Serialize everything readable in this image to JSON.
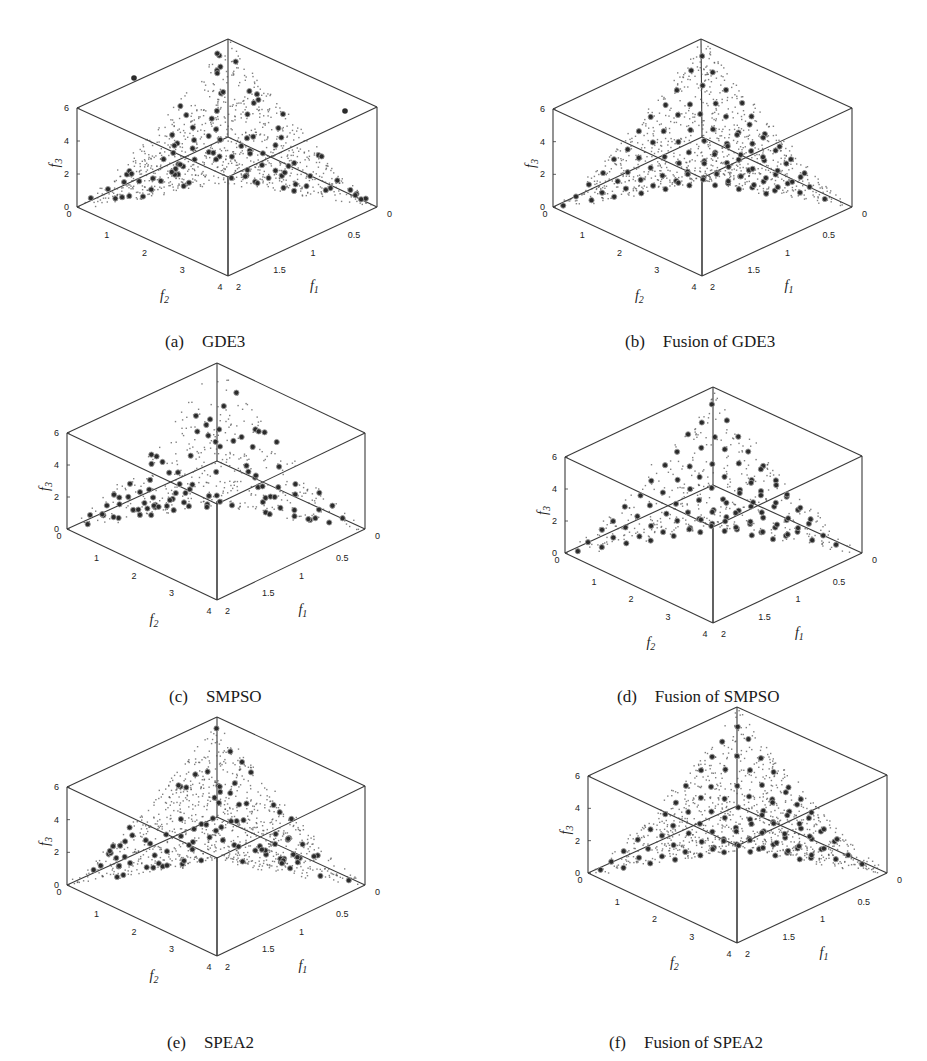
{
  "figure": {
    "panels": [
      {
        "id": "a",
        "tag": "(a)",
        "title": "GDE3",
        "caption_pos": [
          148,
          312
        ],
        "geom": {
          "top": [
            228,
            39
          ],
          "left6": [
            77,
            108
          ],
          "right6": [
            377,
            107
          ],
          "left0": [
            77,
            207
          ],
          "right0": [
            377,
            207
          ],
          "front": [
            228,
            276
          ],
          "back": [
            228,
            137
          ]
        },
        "density": "dense",
        "big_markers": 95,
        "outliers": [
          [
            134,
            78
          ],
          [
            345,
            111
          ]
        ]
      },
      {
        "id": "b",
        "tag": "(b)",
        "title": "Fusion of GDE3",
        "caption_pos": [
          608,
          312
        ],
        "geom": {
          "top": [
            701,
            39
          ],
          "left6": [
            553,
            109
          ],
          "right6": [
            852,
            108
          ],
          "left0": [
            553,
            207
          ],
          "right0": [
            852,
            207
          ],
          "front": [
            702,
            276
          ],
          "back": [
            702,
            137
          ]
        },
        "density": "dense",
        "big_markers": 100,
        "outliers": []
      },
      {
        "id": "c",
        "tag": "(c)",
        "title": "SMPSO",
        "caption_pos": [
          152,
          667
        ],
        "geom": {
          "top": [
            217,
            363
          ],
          "left6": [
            67,
            433
          ],
          "right6": [
            365,
            433
          ],
          "left0": [
            67,
            529
          ],
          "right0": [
            365,
            529
          ],
          "front": [
            217,
            600
          ],
          "back": [
            217,
            461
          ]
        },
        "density": "sparse",
        "big_markers": 95,
        "outliers": []
      },
      {
        "id": "d",
        "tag": "(d)",
        "title": "Fusion of SMPSO",
        "caption_pos": [
          600,
          667
        ],
        "geom": {
          "top": [
            713,
            387
          ],
          "left6": [
            565,
            457
          ],
          "right6": [
            862,
            456
          ],
          "left0": [
            565,
            553
          ],
          "right0": [
            862,
            553
          ],
          "front": [
            713,
            623
          ],
          "back": [
            713,
            485
          ]
        },
        "density": "sparse",
        "big_markers": 100,
        "outliers": []
      },
      {
        "id": "e",
        "tag": "(e)",
        "title": "SPEA2",
        "caption_pos": [
          150,
          1013
        ],
        "geom": {
          "top": [
            217,
            717
          ],
          "left6": [
            67,
            787
          ],
          "right6": [
            365,
            786
          ],
          "left0": [
            67,
            885
          ],
          "right0": [
            365,
            885
          ],
          "front": [
            217,
            956
          ],
          "back": [
            217,
            817
          ]
        },
        "density": "dense",
        "big_markers": 95,
        "outliers": []
      },
      {
        "id": "f",
        "tag": "(f)",
        "title": "Fusion of SPEA2",
        "caption_pos": [
          592,
          1013
        ],
        "geom": {
          "top": [
            737,
            707
          ],
          "left6": [
            588,
            776
          ],
          "right6": [
            887,
            775
          ],
          "left0": [
            588,
            873
          ],
          "right0": [
            887,
            873
          ],
          "front": [
            737,
            943
          ],
          "back": [
            737,
            806
          ]
        },
        "density": "dense",
        "big_markers": 100,
        "outliers": []
      }
    ],
    "axes": {
      "f3_label": "f3",
      "f2_label": "f2",
      "f1_label": "f1",
      "f3_ticks": [
        "0",
        "2",
        "4",
        "6"
      ],
      "f2_ticks": [
        "0",
        "1",
        "2",
        "3",
        "4"
      ],
      "f1_ticks": [
        "0",
        "0.5",
        "1",
        "1.5",
        "2"
      ],
      "f1_range": [
        0,
        2
      ],
      "f2_range": [
        0,
        4
      ],
      "f3_range": [
        0,
        6
      ]
    },
    "colors": {
      "box": "#3a3a3a",
      "dot": "#555555",
      "marker_fill": "#2b2b2b",
      "marker_ring": "#9a9a9a",
      "text": "#222222"
    }
  },
  "chart_data": [
    {
      "type": "scatter",
      "subtype": "3d-scatter",
      "title": "(a) GDE3",
      "xlabel": "f1",
      "ylabel": "f2",
      "zlabel": "f3",
      "xlim": [
        0,
        2
      ],
      "ylim": [
        0,
        4
      ],
      "zlim": [
        0,
        6
      ],
      "x_ticks": [
        0,
        0.5,
        1,
        1.5,
        2
      ],
      "y_ticks": [
        0,
        1,
        2,
        3,
        4
      ],
      "z_ticks": [
        0,
        2,
        4,
        6
      ],
      "series": [
        {
          "name": "true Pareto front (small dots)"
        },
        {
          "name": "obtained solutions (large circles)"
        }
      ],
      "description": "Inverted triangular Pareto front from (0,0,6) apex down to the f1 and f2 axes near f3=0; obtained solutions spread along front with two outliers."
    },
    {
      "type": "scatter",
      "subtype": "3d-scatter",
      "title": "(b) Fusion of GDE3",
      "xlabel": "f1",
      "ylabel": "f2",
      "zlabel": "f3",
      "xlim": [
        0,
        2
      ],
      "ylim": [
        0,
        4
      ],
      "zlim": [
        0,
        6
      ],
      "x_ticks": [
        0,
        0.5,
        1,
        1.5,
        2
      ],
      "y_ticks": [
        0,
        1,
        2,
        3,
        4
      ],
      "z_ticks": [
        0,
        2,
        4,
        6
      ],
      "series": [
        {
          "name": "true Pareto front (small dots)"
        },
        {
          "name": "obtained solutions (large circles)"
        }
      ],
      "description": "Solutions evenly distributed over the front in a regular lattice."
    },
    {
      "type": "scatter",
      "subtype": "3d-scatter",
      "title": "(c) SMPSO",
      "xlabel": "f1",
      "ylabel": "f2",
      "zlabel": "f3",
      "xlim": [
        0,
        2
      ],
      "ylim": [
        0,
        4
      ],
      "zlim": [
        0,
        6
      ],
      "x_ticks": [
        0,
        0.5,
        1,
        1.5,
        2
      ],
      "y_ticks": [
        0,
        1,
        2,
        3,
        4
      ],
      "z_ticks": [
        0,
        2,
        4,
        6
      ],
      "series": [
        {
          "name": "true Pareto front (small dots)"
        },
        {
          "name": "obtained solutions (large circles)"
        }
      ],
      "description": "Sparser reference dots; solutions clustered near edges and apex."
    },
    {
      "type": "scatter",
      "subtype": "3d-scatter",
      "title": "(d) Fusion of SMPSO",
      "xlabel": "f1",
      "ylabel": "f2",
      "zlabel": "f3",
      "xlim": [
        0,
        2
      ],
      "ylim": [
        0,
        4
      ],
      "zlim": [
        0,
        6
      ],
      "x_ticks": [
        0,
        0.5,
        1,
        1.5,
        2
      ],
      "y_ticks": [
        0,
        1,
        2,
        3,
        4
      ],
      "z_ticks": [
        0,
        2,
        4,
        6
      ],
      "series": [
        {
          "name": "true Pareto front (small dots)"
        },
        {
          "name": "obtained solutions (large circles)"
        }
      ],
      "description": "Solutions spread more uniformly across the front."
    },
    {
      "type": "scatter",
      "subtype": "3d-scatter",
      "title": "(e) SPEA2",
      "xlabel": "f1",
      "ylabel": "f2",
      "zlabel": "f3",
      "xlim": [
        0,
        2
      ],
      "ylim": [
        0,
        4
      ],
      "zlim": [
        0,
        6
      ],
      "x_ticks": [
        0,
        0.5,
        1,
        1.5,
        2
      ],
      "y_ticks": [
        0,
        1,
        2,
        3,
        4
      ],
      "z_ticks": [
        0,
        2,
        4,
        6
      ],
      "series": [
        {
          "name": "true Pareto front (small dots)"
        },
        {
          "name": "obtained solutions (large circles)"
        }
      ],
      "description": "Solutions concentrated along the apex ridges."
    },
    {
      "type": "scatter",
      "subtype": "3d-scatter",
      "title": "(f) Fusion of SPEA2",
      "xlabel": "f1",
      "ylabel": "f2",
      "zlabel": "f3",
      "xlim": [
        0,
        2
      ],
      "ylim": [
        0,
        4
      ],
      "zlim": [
        0,
        6
      ],
      "x_ticks": [
        0,
        0.5,
        1,
        1.5,
        2
      ],
      "y_ticks": [
        0,
        1,
        2,
        3,
        4
      ],
      "z_ticks": [
        0,
        2,
        4,
        6
      ],
      "series": [
        {
          "name": "true Pareto front (small dots)"
        },
        {
          "name": "obtained solutions (large circles)"
        }
      ],
      "description": "Solutions form a regular, evenly spaced lattice over the front."
    }
  ]
}
